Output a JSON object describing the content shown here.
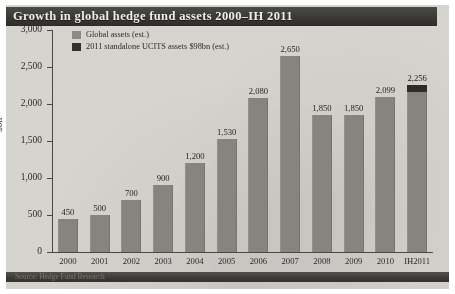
{
  "figure": {
    "title": "Growth in global hedge fund assets 2000–IH 2011",
    "source": "Source: Hedge Fund Research"
  },
  "legend": {
    "items": [
      {
        "label": "Global assets (est.)",
        "color": "#8b8a86"
      },
      {
        "label": "2011 standalone UCITS assets $98bn (est.)",
        "color": "#33312e"
      }
    ]
  },
  "chart_data": {
    "type": "bar",
    "title": "Growth in global hedge fund assets 2000–IH 2011",
    "xlabel": "",
    "ylabel": "$bn",
    "ylim": [
      0,
      3000
    ],
    "yticks": [
      0,
      500,
      1000,
      1500,
      2000,
      2500,
      3000
    ],
    "ytick_labels": [
      "0",
      "500",
      "1,000",
      "1,500",
      "2,000",
      "2,500",
      "3,000"
    ],
    "grid": false,
    "legend_position": "top-left",
    "categories": [
      "2000",
      "2001",
      "2002",
      "2003",
      "2004",
      "2005",
      "2006",
      "2007",
      "2008",
      "2009",
      "2010",
      "IH2011"
    ],
    "series": [
      {
        "name": "Global assets (est.)",
        "color": "#8b8a86",
        "values": [
          450,
          500,
          700,
          900,
          1200,
          1530,
          2080,
          2650,
          1850,
          1850,
          2099,
          2158
        ]
      },
      {
        "name": "2011 standalone UCITS assets $98bn (est.)",
        "color": "#33312e",
        "values": [
          0,
          0,
          0,
          0,
          0,
          0,
          0,
          0,
          0,
          0,
          0,
          98
        ]
      }
    ],
    "data_labels": [
      "450",
      "500",
      "700",
      "900",
      "1,200",
      "1,530",
      "2,080",
      "2,650",
      "1,850",
      "1,850",
      "2,099",
      "2,256"
    ],
    "totals": [
      450,
      500,
      700,
      900,
      1200,
      1530,
      2080,
      2650,
      1850,
      1850,
      2099,
      2256
    ]
  }
}
